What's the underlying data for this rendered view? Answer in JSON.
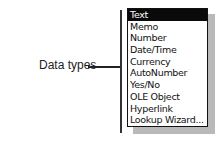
{
  "annotation": {
    "label": "Data types"
  },
  "dropdown": {
    "selected_index": 0,
    "items": [
      {
        "label": "Text"
      },
      {
        "label": "Memo"
      },
      {
        "label": "Number"
      },
      {
        "label": "Date/Time"
      },
      {
        "label": "Currency"
      },
      {
        "label": "AutoNumber"
      },
      {
        "label": "Yes/No"
      },
      {
        "label": "OLE Object"
      },
      {
        "label": "Hyperlink"
      },
      {
        "label": "Lookup Wizard..."
      }
    ]
  },
  "colors": {
    "selected_bg": "#0a0a0a",
    "selected_fg": "#ffffff",
    "shadow": "#b9b9b9"
  }
}
